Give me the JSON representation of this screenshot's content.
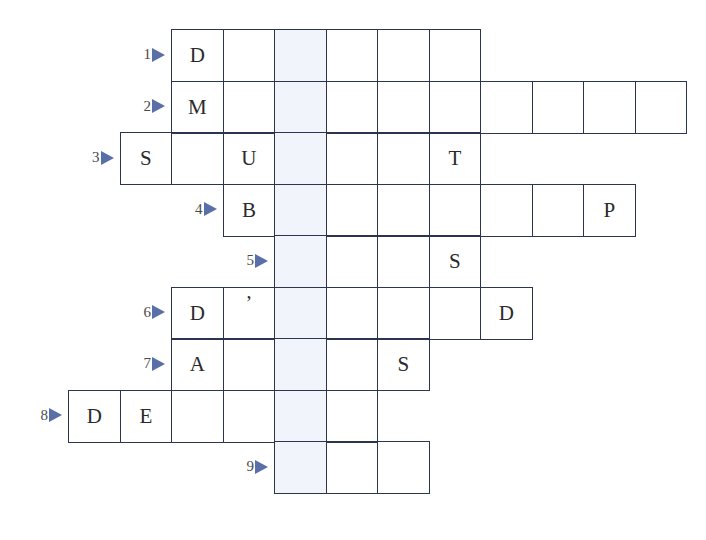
{
  "puzzle": {
    "type": "crossword",
    "cell_size": 51.5,
    "origin_x": 68,
    "origin_y": 29,
    "highlight_column": 4,
    "colors": {
      "grid_line": "#2c3550",
      "highlight": "#f1f5fb",
      "arrow": "#5a6fa8",
      "letter": "#2a2a2a",
      "number": "#4a4a4a"
    },
    "rows": [
      {
        "number": "1",
        "start_col": 2,
        "length": 6,
        "letters": {
          "2": "D"
        }
      },
      {
        "number": "2",
        "start_col": 2,
        "length": 10,
        "letters": {
          "2": "M"
        }
      },
      {
        "number": "3",
        "start_col": 1,
        "length": 7,
        "letters": {
          "1": "S",
          "3": "U",
          "7": "T"
        }
      },
      {
        "number": "4",
        "start_col": 3,
        "length": 8,
        "letters": {
          "3": "B",
          "10": "P"
        }
      },
      {
        "number": "5",
        "start_col": 4,
        "length": 4,
        "letters": {
          "7": "S"
        }
      },
      {
        "number": "6",
        "start_col": 2,
        "length": 7,
        "letters": {
          "2": "D",
          "3": "’",
          "8": "D"
        }
      },
      {
        "number": "7",
        "start_col": 2,
        "length": 5,
        "letters": {
          "2": "A",
          "6": "S"
        }
      },
      {
        "number": "8",
        "start_col": 0,
        "length": 6,
        "letters": {
          "0": "D",
          "1": "E"
        }
      },
      {
        "number": "9",
        "start_col": 4,
        "length": 3,
        "letters": {}
      }
    ]
  }
}
